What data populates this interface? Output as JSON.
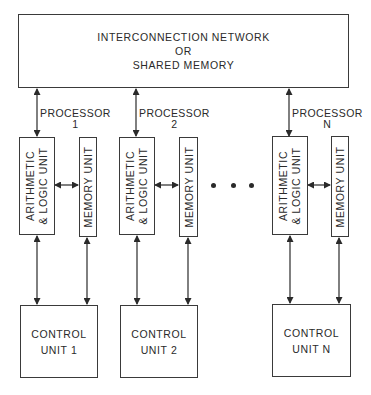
{
  "shared": {
    "line1": "INTERCONNECTION NETWORK",
    "line2": "OR",
    "line3": "SHARED MEMORY"
  },
  "processors": [
    {
      "label": "PROCESSOR",
      "index": "1",
      "alu": {
        "line1": "ARITHMETIC",
        "line2": "& LOGIC UNIT"
      },
      "memory": "MEMORY UNIT",
      "control": {
        "line1": "CONTROL",
        "line2": "UNIT 1"
      }
    },
    {
      "label": "PROCESSOR",
      "index": "2",
      "alu": {
        "line1": "ARITHMETIC",
        "line2": "& LOGIC UNIT"
      },
      "memory": "MEMORY UNIT",
      "control": {
        "line1": "CONTROL",
        "line2": "UNIT 2"
      }
    },
    {
      "label": "PROCESSOR",
      "index": "N",
      "alu": {
        "line1": "ARITHMETIC",
        "line2": "& LOGIC UNIT"
      },
      "memory": "MEMORY UNIT",
      "control": {
        "line1": "CONTROL",
        "line2": "UNIT N"
      }
    }
  ],
  "ellipsis": "• • •",
  "colors": {
    "ink": "#2a2a2a",
    "background": "#ffffff"
  }
}
